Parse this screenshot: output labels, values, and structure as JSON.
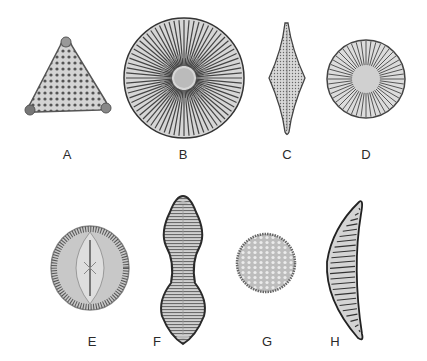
{
  "figure": {
    "specimens": [
      {
        "label": "A",
        "shape": "triangular",
        "x": 67,
        "y": 154
      },
      {
        "label": "B",
        "shape": "circular-radial-large",
        "x": 183,
        "y": 154
      },
      {
        "label": "C",
        "shape": "rhomboid-elongate",
        "x": 287,
        "y": 154
      },
      {
        "label": "D",
        "shape": "circular-radial",
        "x": 366,
        "y": 154
      },
      {
        "label": "E",
        "shape": "oval-raphid",
        "x": 92,
        "y": 341
      },
      {
        "label": "F",
        "shape": "constricted-panduriform",
        "x": 157,
        "y": 341
      },
      {
        "label": "G",
        "shape": "circular-areolate",
        "x": 267,
        "y": 341
      },
      {
        "label": "H",
        "shape": "crescent-lunate",
        "x": 335,
        "y": 341
      }
    ],
    "colors": {
      "background": "#ffffff",
      "ink": "#3a3a3a",
      "fill": "#cfcfcf",
      "label": "#2a2a2a"
    }
  }
}
